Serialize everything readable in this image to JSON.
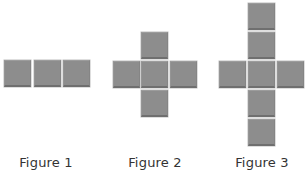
{
  "figures": [
    {
      "label": "Figure 1",
      "caption_center_x": 46,
      "tiles": [
        {
          "x": 4,
          "y": 60
        },
        {
          "x": 34,
          "y": 60
        },
        {
          "x": 63,
          "y": 60
        }
      ]
    },
    {
      "label": "Figure 2",
      "caption_center_x": 155,
      "tiles": [
        {
          "x": 141,
          "y": 32
        },
        {
          "x": 113,
          "y": 61
        },
        {
          "x": 141,
          "y": 61
        },
        {
          "x": 170,
          "y": 61
        },
        {
          "x": 141,
          "y": 90
        }
      ]
    },
    {
      "label": "Figure 3",
      "caption_center_x": 262,
      "tiles": [
        {
          "x": 248,
          "y": 3
        },
        {
          "x": 248,
          "y": 32
        },
        {
          "x": 219,
          "y": 61
        },
        {
          "x": 248,
          "y": 61
        },
        {
          "x": 277,
          "y": 61
        },
        {
          "x": 248,
          "y": 90
        },
        {
          "x": 248,
          "y": 119
        }
      ]
    }
  ],
  "colors": {
    "tile_fill": "#8d8d8d",
    "tile_shadow": "#6f6f6f",
    "caption_text": "#333333",
    "background": "#ffffff"
  }
}
